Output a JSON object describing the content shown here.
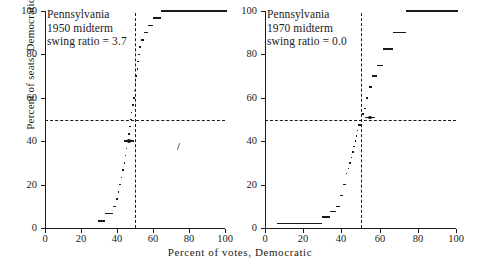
{
  "chart_data": {
    "type": "line",
    "title": "",
    "xlabel": "Percent  of  votes, Democratic",
    "ylabel": "Percent of seats, Democratic",
    "xlim": [
      0,
      100
    ],
    "ylim": [
      0,
      100
    ],
    "xticks": [
      0,
      20,
      40,
      60,
      80,
      100
    ],
    "yticks": [
      0,
      20,
      40,
      60,
      80,
      100
    ],
    "grid": false,
    "legend": null,
    "reference_lines": {
      "horizontal_seats_pct": 50,
      "vertical_votes_pct": 50,
      "style": "dashed"
    },
    "panels": [
      {
        "name": "pennsylvania-1950-midterm",
        "state": "Pennsylvania",
        "election": "1950 midterm",
        "swing_ratio_label": "swing ratio = 3.7",
        "swing_ratio": 3.7,
        "observed_point": {
          "votes": 46.8,
          "seats": 40.0
        },
        "series": [
          {
            "name": "seats-votes curve",
            "x": [
              29.5,
              31.0,
              33.5,
              36.0,
              38.0,
              39.2,
              40.3,
              41.3,
              42.1,
              42.9,
              43.6,
              44.3,
              44.9,
              45.5,
              46.1,
              46.7,
              47.2,
              47.7,
              48.2,
              48.7,
              49.1,
              49.5,
              49.9,
              50.2,
              50.5,
              50.9,
              51.3,
              51.8,
              52.4,
              53.1,
              53.9,
              54.8,
              55.8,
              57.0,
              58.4,
              60.0,
              62.0,
              64.5,
              67.0,
              100.0
            ],
            "y": [
              3.3,
              3.3,
              6.7,
              6.7,
              10.0,
              13.3,
              16.7,
              20.0,
              23.3,
              26.7,
              30.0,
              33.3,
              36.7,
              40.0,
              43.3,
              46.7,
              50.0,
              53.3,
              56.7,
              56.7,
              60.0,
              63.3,
              66.7,
              70.0,
              70.0,
              73.3,
              76.7,
              80.0,
              83.3,
              86.7,
              86.7,
              90.0,
              90.0,
              93.3,
              93.3,
              96.7,
              96.7,
              100.0,
              100.0,
              100.0
            ]
          }
        ]
      },
      {
        "name": "pennsylvania-1970-midterm",
        "state": "Pennsylvania",
        "election": "1970 midterm",
        "swing_ratio_label": "swing ratio = 0.0",
        "swing_ratio": 0.0,
        "observed_point": {
          "votes": 55.0,
          "seats": 51.0
        },
        "series": [
          {
            "name": "seats-votes curve",
            "x": [
              6.0,
              25.0,
              30.0,
              34.0,
              37.0,
              39.5,
              41.0,
              42.2,
              43.2,
              44.1,
              44.9,
              45.6,
              46.3,
              46.9,
              47.5,
              48.1,
              48.7,
              49.3,
              50.0,
              50.8,
              51.7,
              52.8,
              54.2,
              56.0,
              58.5,
              62.0,
              67.0,
              74.0,
              100.0
            ],
            "y": [
              2.0,
              2.0,
              5.0,
              7.5,
              10.0,
              15.0,
              20.0,
              25.0,
              27.5,
              30.0,
              32.5,
              35.0,
              37.5,
              40.0,
              42.5,
              45.0,
              47.5,
              47.5,
              50.0,
              52.5,
              55.0,
              60.0,
              65.0,
              70.0,
              75.0,
              82.5,
              90.0,
              100.0,
              100.0
            ]
          }
        ]
      }
    ]
  },
  "figure": {
    "xlabel": "Percent  of  votes, Democratic",
    "ylabel": "Percent of seats, Democratic"
  },
  "left_panel": {
    "line1": "Pennsylvania",
    "line2": "1950  midterm",
    "line3": "swing ratio = 3.7",
    "ticklabels_y": [
      "0",
      "20",
      "40",
      "60",
      "80",
      "100"
    ],
    "ticklabels_x": [
      "0",
      "20",
      "40",
      "60",
      "80",
      "100"
    ]
  },
  "right_panel": {
    "line1": "Pennsylvania",
    "line2": "1970  midterm",
    "line3": "swing ratio = 0.0",
    "ticklabels_y": [
      "0",
      "20",
      "40",
      "60",
      "80",
      "100"
    ],
    "ticklabels_x": [
      "0",
      "20",
      "40",
      "60",
      "80",
      "100"
    ]
  }
}
